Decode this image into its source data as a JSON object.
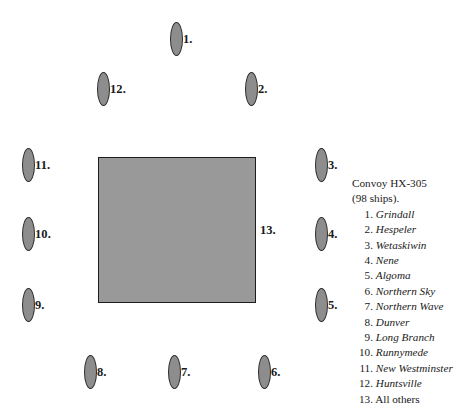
{
  "diagram": {
    "convoy_block": {
      "label": "13.",
      "fill_color": "#999999",
      "border_color": "#1c1c1c",
      "x": 98,
      "y": 157,
      "width": 158,
      "height": 146
    },
    "marker_style": {
      "fill_color": "#8d8d8d",
      "border_color": "#2b2b2b"
    },
    "markers": [
      {
        "label": "1.",
        "x": 170,
        "y": 22
      },
      {
        "label": "12.",
        "x": 97,
        "y": 72
      },
      {
        "label": "2.",
        "x": 245,
        "y": 72
      },
      {
        "label": "11.",
        "x": 22,
        "y": 148
      },
      {
        "label": "3.",
        "x": 315,
        "y": 148
      },
      {
        "label": "10.",
        "x": 22,
        "y": 217
      },
      {
        "label": "4.",
        "x": 315,
        "y": 217
      },
      {
        "label": "9.",
        "x": 22,
        "y": 288
      },
      {
        "label": "5.",
        "x": 315,
        "y": 288
      },
      {
        "label": "8.",
        "x": 84,
        "y": 355
      },
      {
        "label": "7.",
        "x": 168,
        "y": 355
      },
      {
        "label": "6.",
        "x": 258,
        "y": 355
      }
    ]
  },
  "legend": {
    "title": "Convoy HX-305",
    "subtitle": "(98 ships).",
    "entries": [
      {
        "number": "1.",
        "name": "Grindall",
        "italic": true
      },
      {
        "number": "2.",
        "name": "Hespeler",
        "italic": true
      },
      {
        "number": "3.",
        "name": "Wetaskiwin",
        "italic": true
      },
      {
        "number": "4.",
        "name": "Nene",
        "italic": true
      },
      {
        "number": "5.",
        "name": "Algoma",
        "italic": true
      },
      {
        "number": "6.",
        "name": "Northern Sky",
        "italic": true
      },
      {
        "number": "7.",
        "name": "Northern Wave",
        "italic": true
      },
      {
        "number": "8.",
        "name": "Dunver",
        "italic": true
      },
      {
        "number": "9.",
        "name": "Long Branch",
        "italic": true
      },
      {
        "number": "10.",
        "name": "Runnymede",
        "italic": true
      },
      {
        "number": "11.",
        "name": "New Westminster",
        "italic": true
      },
      {
        "number": "12.",
        "name": "Huntsville",
        "italic": true
      },
      {
        "number": "13.",
        "name": "All others",
        "italic": false
      }
    ]
  }
}
